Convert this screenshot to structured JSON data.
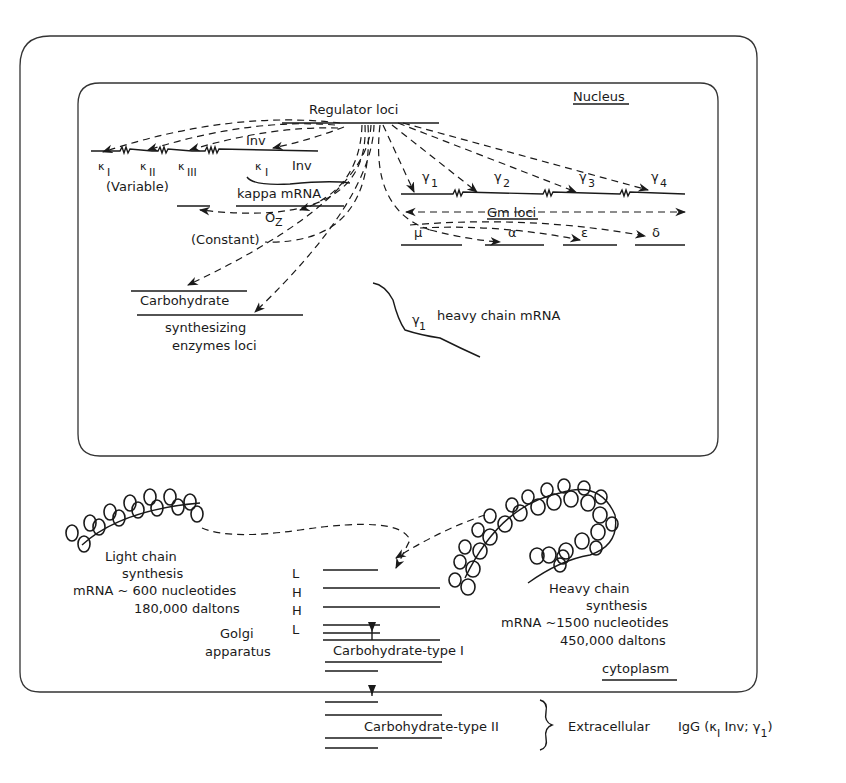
{
  "compartments": {
    "nucleus_label": "Nucleus",
    "cytoplasm_label": "cytoplasm"
  },
  "nucleus": {
    "regulator_loci": "Regulator loci",
    "inv_top": "Inv",
    "kappa_variable": {
      "k1": "κ",
      "k1_sub": "I",
      "k2": "κ",
      "k2_sub": "II",
      "k3": "κ",
      "k3_sub": "III",
      "label": "(Variable)"
    },
    "kappa_mrna": {
      "k": "κ",
      "k_sub": "I",
      "inv": "Inv",
      "label": "kappa mRNA"
    },
    "oz": "O",
    "oz_sub": "Z",
    "constant_label": "(Constant)",
    "gamma": [
      {
        "sym": "γ",
        "sub": "1"
      },
      {
        "sym": "γ",
        "sub": "2"
      },
      {
        "sym": "γ",
        "sub": "3"
      },
      {
        "sym": "γ",
        "sub": "4"
      }
    ],
    "gm_loci": "Gm loci",
    "other_heavy": [
      "μ",
      "α",
      "ε",
      "δ"
    ],
    "carbohydrate": "Carbohydrate",
    "carb_enzymes_line1": "synthesizing",
    "carb_enzymes_line2": "enzymes loci",
    "heavy_mrna": {
      "sym": "γ",
      "sub": "1",
      "label": "heavy chain mRNA"
    }
  },
  "cytoplasm": {
    "light_chain": {
      "line1": "Light chain",
      "line2": "synthesis",
      "line3": "mRNA ~ 600 nucleotides",
      "line4": "180,000 daltons"
    },
    "heavy_chain": {
      "line1": "Heavy chain",
      "line2": "synthesis",
      "line3": "mRNA ~1500 nucleotides",
      "line4": "450,000 daltons"
    },
    "chain_letters": [
      "L",
      "H",
      "H",
      "L"
    ],
    "golgi_line1": "Golgi",
    "golgi_line2": "apparatus",
    "carb_type1": "Carbohydrate-type I"
  },
  "extracellular": {
    "carb_type2": "Carbohydrate-type II",
    "label": "Extracellular",
    "igg": "IgG (κ",
    "igg_sub": "I",
    "igg_rest": " Inv; γ",
    "igg_sub2": "1",
    "igg_close": ")"
  }
}
